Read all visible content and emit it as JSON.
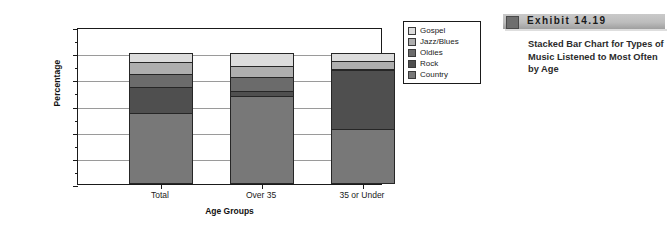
{
  "exhibit": {
    "number_label": "Exhibit   14.19",
    "caption": "Stacked Bar Chart for Types of Music Listened to Most Often by Age"
  },
  "chart_data": {
    "type": "bar",
    "stacked": true,
    "title": "",
    "xlabel": "Age Groups",
    "ylabel": "Percentage",
    "categories": [
      "Total",
      "Over 35",
      "35 or Under"
    ],
    "ylim": [
      0,
      120
    ],
    "ytick_labels": [
      "0%",
      "20%",
      "40%",
      "60%",
      "80%",
      "100%",
      "120%"
    ],
    "ytick_values": [
      0,
      20,
      40,
      60,
      80,
      100,
      120
    ],
    "minor_tick_values": [
      10,
      30,
      50,
      70,
      90,
      110
    ],
    "grid": true,
    "legend_position": "right",
    "series": [
      {
        "name": "Country",
        "color": "#787878",
        "values": [
          54,
          67,
          42
        ]
      },
      {
        "name": "Rock",
        "color": "#4f4f4f",
        "values": [
          20,
          4,
          45
        ]
      },
      {
        "name": "Oldies",
        "color": "#6b6b6b",
        "values": [
          10,
          11,
          1
        ]
      },
      {
        "name": "Jazz/Blues",
        "color": "#aeaeae",
        "values": [
          9,
          8,
          6
        ]
      },
      {
        "name": "Gospel",
        "color": "#dcdcdc",
        "values": [
          7,
          10,
          6
        ]
      }
    ],
    "legend_entries": [
      "Gospel",
      "Jazz/Blues",
      "Oldies",
      "Rock",
      "Country"
    ]
  }
}
